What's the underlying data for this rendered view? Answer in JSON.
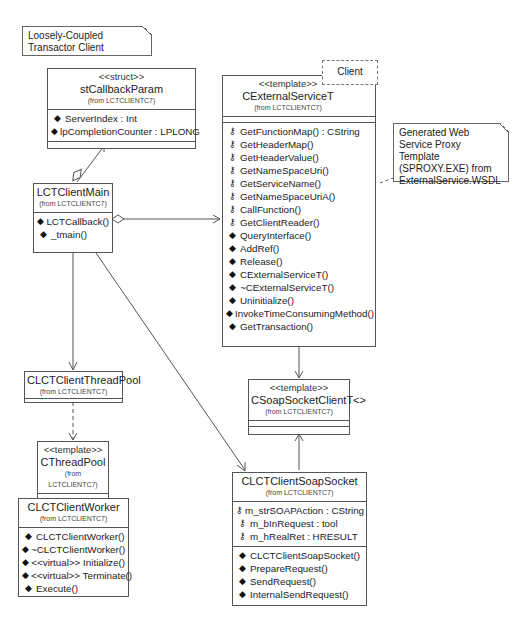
{
  "notes": [
    {
      "text": "Loosely-Coupled Transactor Client"
    },
    {
      "text": "Generated Web Service Proxy Template (SPROXY.EXE) from ExternalService.WSDL"
    }
  ],
  "classes": {
    "stCallbackParam": {
      "stereotype": "<<struct>>",
      "name": "stCallbackParam",
      "from": "(from LCTCLIENTC7)",
      "attributes": [
        {
          "icon": "public-diamond-icon",
          "text": "ServerIndex : Int"
        },
        {
          "icon": "public-diamond-icon",
          "text": "lpCompletionCounter : LPLONG"
        }
      ],
      "operations": []
    },
    "LCTClientMain": {
      "name": "LCTClientMain",
      "from": "(from LCTCLIENTC7)",
      "attributes": [],
      "operations": [
        {
          "icon": "public-diamond-icon",
          "text": "LCTCallback()"
        },
        {
          "icon": "public-diamond-icon",
          "text": "_tmain()"
        }
      ]
    },
    "CExternalServiceT": {
      "stereotype": "<<template>>",
      "name": "CExternalServiceT",
      "from": "(from LCTCLIENTC7)",
      "template_param": "Client",
      "attributes": [],
      "operations": [
        {
          "icon": "protected-key-icon",
          "text": "GetFunctionMap() : CString"
        },
        {
          "icon": "protected-key-icon",
          "text": "GetHeaderMap()"
        },
        {
          "icon": "protected-key-icon",
          "text": "GetHeaderValue()"
        },
        {
          "icon": "protected-key-icon",
          "text": "GetNameSpaceUri()"
        },
        {
          "icon": "protected-key-icon",
          "text": "GetServiceName()"
        },
        {
          "icon": "protected-key-icon",
          "text": "GetNameSpaceUriA()"
        },
        {
          "icon": "protected-key-icon",
          "text": "CallFunction()"
        },
        {
          "icon": "protected-key-icon",
          "text": "GetClientReader()"
        },
        {
          "icon": "public-diamond-icon",
          "text": "QueryInterface()"
        },
        {
          "icon": "public-diamond-icon",
          "text": "AddRef()"
        },
        {
          "icon": "public-diamond-icon",
          "text": "Release()"
        },
        {
          "icon": "public-diamond-icon",
          "text": "CExternalServiceT()"
        },
        {
          "icon": "public-diamond-icon",
          "text": "~CExternalServiceT()"
        },
        {
          "icon": "public-diamond-icon",
          "text": "Uninitialize()"
        },
        {
          "icon": "public-diamond-icon",
          "text": "InvokeTimeConsumingMethod()"
        },
        {
          "icon": "public-diamond-icon",
          "text": "GetTransaction()"
        }
      ]
    },
    "CLCTClientThreadPool": {
      "name": "CLCTClientThreadPool",
      "from": "(from LCTCLIENTC7)"
    },
    "CThreadPool": {
      "stereotype": "<<template>>",
      "name": "CThreadPool",
      "from": "(from LCTCLIENTC7)"
    },
    "CLCTClientWorker": {
      "name": "CLCTClientWorker",
      "from": "(from LCTCLIENTC7)",
      "operations": [
        {
          "icon": "public-diamond-icon",
          "text": "CLCTClientWorker()"
        },
        {
          "icon": "public-diamond-icon",
          "text": "~CLCTClientWorker()"
        },
        {
          "icon": "public-diamond-icon",
          "text": "<<virtual>> Initialize()"
        },
        {
          "icon": "public-diamond-icon",
          "text": "<<virtual>> Terminate()"
        },
        {
          "icon": "public-diamond-icon",
          "text": "Execute()"
        }
      ]
    },
    "CSoapSocketClientT": {
      "stereotype": "<<template>>",
      "name": "CSoapSocketClientT<>",
      "from": "(from LCTCLIENTC7)"
    },
    "CLCTClientSoapSocket": {
      "name": "CLCTClientSoapSocket",
      "from": "(from LCTCLIENTC7)",
      "attributes": [
        {
          "icon": "protected-key-icon",
          "text": "m_strSOAPAction : CString"
        },
        {
          "icon": "protected-key-icon",
          "text": "m_bInRequest : tool"
        },
        {
          "icon": "protected-key-icon",
          "text": "m_hRealRet : HRESULT"
        }
      ],
      "operations": [
        {
          "icon": "public-diamond-icon",
          "text": "CLCTClientSoapSocket()"
        },
        {
          "icon": "public-diamond-icon",
          "text": "PrepareRequest()"
        },
        {
          "icon": "public-diamond-icon",
          "text": "SendRequest()"
        },
        {
          "icon": "public-diamond-icon",
          "text": "InternalSendRequest()"
        }
      ]
    }
  },
  "relations": [
    {
      "from": "LCTClientMain",
      "to": "stCallbackParam",
      "type": "aggregation-navigable"
    },
    {
      "from": "LCTClientMain",
      "to": "CExternalServiceT",
      "type": "aggregation-navigable"
    },
    {
      "from": "LCTClientMain",
      "to": "CLCTClientThreadPool",
      "type": "association"
    },
    {
      "from": "LCTClientMain",
      "to": "CLCTClientSoapSocket",
      "type": "association"
    },
    {
      "from": "CLCTClientThreadPool",
      "to": "CThreadPool",
      "type": "dependency"
    },
    {
      "from": "CThreadPool",
      "to": "CLCTClientWorker",
      "type": "association"
    },
    {
      "from": "CExternalServiceT",
      "to": "CSoapSocketClientT",
      "type": "association"
    },
    {
      "from": "CLCTClientSoapSocket",
      "to": "CSoapSocketClientT",
      "type": "association"
    },
    {
      "from": "note-proxy",
      "to": "CExternalServiceT",
      "type": "note-anchor"
    }
  ]
}
